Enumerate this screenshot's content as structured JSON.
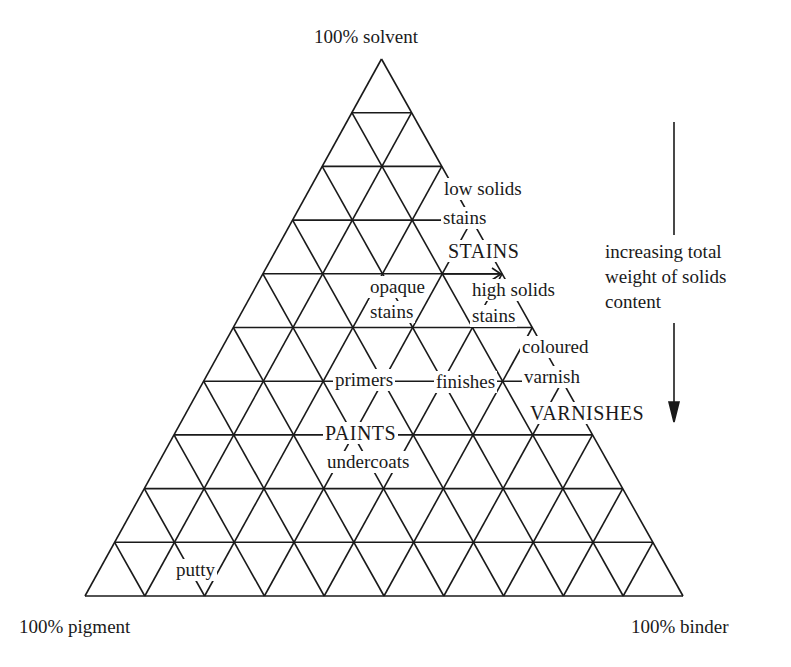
{
  "diagram": {
    "type": "ternary-triangle",
    "grid_divisions": 10,
    "line_color": "#1a1a1a",
    "corners": {
      "top": "100% solvent",
      "bottom_left": "100% pigment",
      "bottom_right": "100% binder"
    },
    "regions": {
      "low_solids_stains": [
        "low solids",
        "stains"
      ],
      "stains_group": "STAINS",
      "opaque_stains": [
        "opaque",
        "stains"
      ],
      "high_solids_stains": [
        "high solids",
        "stains"
      ],
      "coloured_varnish": [
        "coloured",
        "varnish"
      ],
      "primers": "primers",
      "finishes": "finishes",
      "varnishes_group": "VARNISHES",
      "paints_group": "PAINTS",
      "undercoats": "undercoats",
      "putty": "putty"
    },
    "axis_note": {
      "lines": [
        "increasing total",
        "weight of solids",
        "content"
      ],
      "direction": "down"
    }
  }
}
